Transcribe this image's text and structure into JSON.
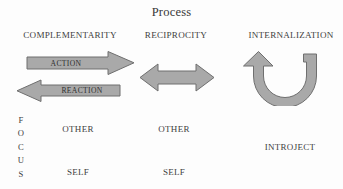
{
  "title": "Process",
  "axes": {
    "process_label": "Process",
    "focus_label": "FOCUS",
    "focus_letters": [
      "F",
      "O",
      "C",
      "U",
      "S"
    ]
  },
  "columns": [
    {
      "header": "COMPLEMENTARITY"
    },
    {
      "header": "RECIPROCITY"
    },
    {
      "header": "INTERNALIZATION"
    }
  ],
  "arrows": {
    "action": {
      "label": "ACTION",
      "direction": "right"
    },
    "reaction": {
      "label": "REACTION",
      "direction": "left"
    },
    "reciprocity": {
      "label": "",
      "direction": "bidirectional"
    },
    "internalization": {
      "label": "",
      "direction": "u-turn-up-left"
    }
  },
  "focus_cells": [
    {
      "label": "OTHER",
      "column": 1,
      "row": "other"
    },
    {
      "label": "OTHER",
      "column": 2,
      "row": "other"
    },
    {
      "label": "INTROJECT",
      "column": 3,
      "row": "middle"
    },
    {
      "label": "SELF",
      "column": 1,
      "row": "self"
    },
    {
      "label": "SELF",
      "column": 2,
      "row": "self"
    }
  ],
  "colors": {
    "background": "#fdfdfd",
    "text": "#3a3a3a",
    "arrow_fill": "#a9a9a9",
    "arrow_stroke": "#6f6f6f"
  }
}
